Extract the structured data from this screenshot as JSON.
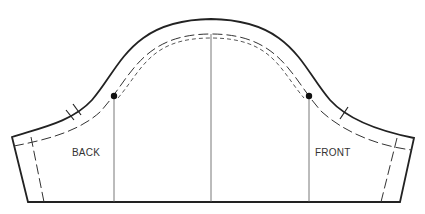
{
  "diagram": {
    "labels": {
      "back": "BACK",
      "front": "FRONT"
    },
    "markings": {
      "back_notch": "double-notch",
      "front_notch": "single-notch",
      "shoulder_point": "center-line",
      "dots": [
        "back-dot",
        "front-dot"
      ]
    },
    "colors": {
      "line": "#222222",
      "background": "#ffffff"
    }
  }
}
